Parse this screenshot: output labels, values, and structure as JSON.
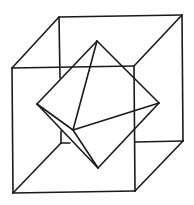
{
  "figure": {
    "stroke_color": "#1a1a1a",
    "background": "#ffffff",
    "cube": {
      "front": [
        [
          12,
          68
        ],
        [
          134,
          66
        ],
        [
          135,
          191
        ],
        [
          13,
          193
        ]
      ],
      "back": [
        [
          59,
          17
        ],
        [
          182,
          15
        ],
        [
          183,
          141
        ],
        [
          61,
          143
        ]
      ]
    },
    "octahedron": {
      "top": [
        97,
        41
      ],
      "left": [
        37,
        104
      ],
      "right": [
        159,
        103
      ],
      "bottom": [
        98,
        168
      ],
      "inner": [
        73,
        130
      ]
    }
  }
}
